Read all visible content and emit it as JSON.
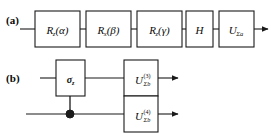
{
  "figure": {
    "background_color": "#ffffff",
    "line_color": "#1a1a1a",
    "width": 276,
    "height": 137
  },
  "panels": [
    {
      "id": "a",
      "label": "(a)",
      "wire_y": 29,
      "wire_start_x": 28,
      "wire_end_x": 268,
      "gates": [
        {
          "name": "rz-alpha",
          "base": "R",
          "sub": "z",
          "arg": "(α)",
          "x": 35,
          "y": 11,
          "w": 45,
          "h": 36
        },
        {
          "name": "rx-beta",
          "base": "R",
          "sub": "x",
          "arg": "(β)",
          "x": 86,
          "y": 11,
          "w": 45,
          "h": 36
        },
        {
          "name": "rz-gamma",
          "base": "R",
          "sub": "z",
          "arg": "(γ)",
          "x": 137,
          "y": 11,
          "w": 45,
          "h": 36
        },
        {
          "name": "hadamard",
          "base": "H",
          "sub": "",
          "arg": "",
          "x": 186,
          "y": 11,
          "w": 27,
          "h": 36
        },
        {
          "name": "u-sigma-a",
          "base": "U",
          "sub": "Σa",
          "arg": "",
          "x": 219,
          "y": 11,
          "w": 35,
          "h": 36
        }
      ]
    },
    {
      "id": "b",
      "label": "(b)",
      "wires": [
        {
          "name": "wire-upper",
          "y": 78,
          "start_x": 40,
          "end_x": 232
        },
        {
          "name": "wire-lower",
          "y": 114,
          "start_x": 26,
          "end_x": 232
        }
      ],
      "control": {
        "name": "control-dot",
        "x": 70,
        "y": 114,
        "r": 4
      },
      "vertical_link": {
        "x": 70,
        "y_top": 96,
        "y_bottom": 114
      },
      "gates": [
        {
          "name": "sigma-z-gate",
          "base": "σ",
          "sub": "z",
          "x": 56,
          "y": 60,
          "w": 29,
          "h": 36
        },
        {
          "name": "u-sigma-b-3",
          "base": "U",
          "sup": "(3)",
          "sub": "Σb",
          "x": 124,
          "y": 60,
          "w": 34,
          "h": 36
        },
        {
          "name": "u-sigma-b-4",
          "base": "U",
          "sup": "(4)",
          "sub": "Σb",
          "x": 124,
          "y": 96,
          "w": 34,
          "h": 36
        }
      ]
    }
  ],
  "caption_symbols": {
    "alpha": "α",
    "beta": "β",
    "gamma": "γ",
    "sigma": "σ",
    "Sigma": "Σ"
  }
}
